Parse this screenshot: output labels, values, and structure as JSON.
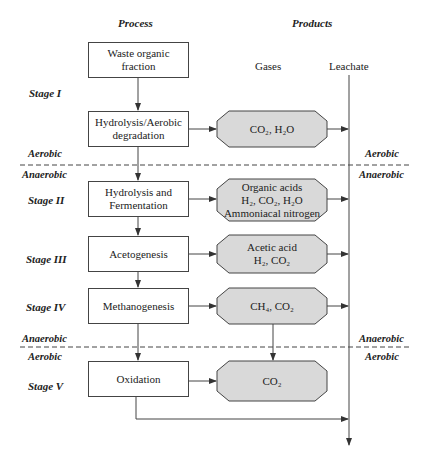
{
  "headers": {
    "process": "Process",
    "products": "Products",
    "gases": "Gases",
    "leachate": "Leachate"
  },
  "stages": [
    "Stage I",
    "Stage II",
    "Stage III",
    "Stage IV",
    "Stage V"
  ],
  "conditions": {
    "left_upper_above": "Aerobic",
    "left_upper_below": "Anaerobic",
    "left_lower_above": "Anaerobic",
    "left_lower_below": "Aerobic",
    "right_upper_above": "Aerobic",
    "right_upper_below": "Anaerobic",
    "right_lower_above": "Anaerobic",
    "right_lower_below": "Aerobic"
  },
  "process_boxes": [
    {
      "line1": "Waste organic",
      "line2": "fraction"
    },
    {
      "line1": "Hydrolysis/Aerobic",
      "line2": "degradation"
    },
    {
      "line1": "Hydrolysis and",
      "line2": "Fermentation"
    },
    {
      "line1": "Acetogenesis"
    },
    {
      "line1": "Methanogenesis"
    },
    {
      "line1": "Oxidation"
    }
  ],
  "gas_boxes": [
    {
      "lines": [
        "CO₂, H₂O"
      ]
    },
    {
      "lines": [
        "Organic acids",
        "H₂, CO₂, H₂O",
        "Ammoniacal nitrogen"
      ]
    },
    {
      "lines": [
        "Acetic acid",
        "H₂, CO₂"
      ]
    },
    {
      "lines": [
        "CH₄, CO₂"
      ]
    },
    {
      "lines": [
        "CO₂"
      ]
    }
  ],
  "colors": {
    "gas_fill": "#d9d9d9",
    "stroke": "#444444"
  }
}
